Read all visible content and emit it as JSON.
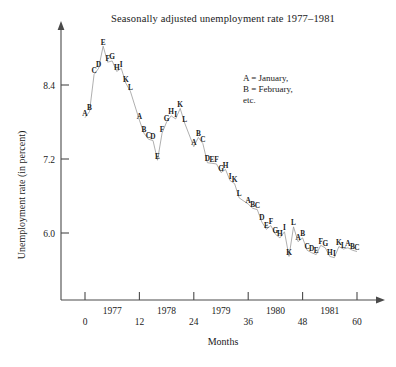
{
  "chart_data": {
    "type": "line",
    "title": "Seasonally adjusted unemployment rate 1977–1981",
    "xlabel": "Months",
    "ylabel": "Unemployment rate (in percent)",
    "xlim": [
      -2,
      64
    ],
    "ylim": [
      5.35,
      9.3
    ],
    "grid": false,
    "legend_position": "upper-right-inside",
    "xticks": [
      0,
      12,
      24,
      36,
      48,
      60
    ],
    "xticklabels": [
      "0",
      "12",
      "24",
      "36",
      "48",
      "60"
    ],
    "year_labels": [
      "1977",
      "1978",
      "1979",
      "1980",
      "1981"
    ],
    "year_label_positions": [
      6,
      18,
      30,
      42,
      54
    ],
    "yticks": [
      6.0,
      7.2,
      8.4
    ],
    "yticklabels": [
      "6.0",
      "7.2",
      "8.4"
    ],
    "legend_lines": [
      "A = January,",
      "B = February,",
      "etc."
    ],
    "point_label_note": "Each plotted point is labelled with a letter for its month: A=January, B=February, C=March, D=April, E=May, F=June, G=July, H=August, I=September, J=October, K=November, L=December",
    "series": [
      {
        "name": "Seasonally adjusted unemployment rate",
        "points": [
          {
            "x": 0,
            "y": 7.87,
            "label": "A"
          },
          {
            "x": 1,
            "y": 7.97,
            "label": "B"
          },
          {
            "x": 2,
            "y": 8.57,
            "label": "C"
          },
          {
            "x": 3,
            "y": 8.67,
            "label": "D"
          },
          {
            "x": 4,
            "y": 9.03,
            "label": "E"
          },
          {
            "x": 5,
            "y": 8.77,
            "label": "F"
          },
          {
            "x": 6,
            "y": 8.79,
            "label": "G"
          },
          {
            "x": 7,
            "y": 8.62,
            "label": "H"
          },
          {
            "x": 8,
            "y": 8.67,
            "label": "I"
          },
          {
            "x": 9,
            "y": 8.43,
            "label": "K"
          },
          {
            "x": 10,
            "y": 8.3,
            "label": "L"
          },
          {
            "x": 12,
            "y": 7.83,
            "label": "A"
          },
          {
            "x": 13,
            "y": 7.62,
            "label": "B"
          },
          {
            "x": 14,
            "y": 7.52,
            "label": "C"
          },
          {
            "x": 15,
            "y": 7.5,
            "label": "D"
          },
          {
            "x": 16,
            "y": 7.18,
            "label": "E"
          },
          {
            "x": 17,
            "y": 7.62,
            "label": "F"
          },
          {
            "x": 18,
            "y": 7.8,
            "label": "G"
          },
          {
            "x": 19,
            "y": 7.9,
            "label": "H"
          },
          {
            "x": 20,
            "y": 7.85,
            "label": "I"
          },
          {
            "x": 21,
            "y": 8.02,
            "label": "K"
          },
          {
            "x": 22,
            "y": 7.78,
            "label": "L"
          },
          {
            "x": 24,
            "y": 7.4,
            "label": "A"
          },
          {
            "x": 25,
            "y": 7.55,
            "label": "B"
          },
          {
            "x": 26,
            "y": 7.45,
            "label": "C"
          },
          {
            "x": 27,
            "y": 7.14,
            "label": "D"
          },
          {
            "x": 28,
            "y": 7.13,
            "label": "E"
          },
          {
            "x": 29,
            "y": 7.12,
            "label": "F"
          },
          {
            "x": 30,
            "y": 6.98,
            "label": "G"
          },
          {
            "x": 31,
            "y": 7.03,
            "label": "H"
          },
          {
            "x": 32,
            "y": 6.85,
            "label": "I"
          },
          {
            "x": 33,
            "y": 6.8,
            "label": "K"
          },
          {
            "x": 34,
            "y": 6.57,
            "label": "L"
          },
          {
            "x": 36,
            "y": 6.47,
            "label": "A"
          },
          {
            "x": 37,
            "y": 6.4,
            "label": "B"
          },
          {
            "x": 38,
            "y": 6.38,
            "label": "C"
          },
          {
            "x": 39,
            "y": 6.18,
            "label": "D"
          },
          {
            "x": 40,
            "y": 6.06,
            "label": "E"
          },
          {
            "x": 41,
            "y": 6.12,
            "label": "F"
          },
          {
            "x": 42,
            "y": 5.98,
            "label": "G"
          },
          {
            "x": 43,
            "y": 5.92,
            "label": "H"
          },
          {
            "x": 44,
            "y": 6.02,
            "label": "I"
          },
          {
            "x": 45,
            "y": 5.62,
            "label": "K"
          },
          {
            "x": 46,
            "y": 6.1,
            "label": "L"
          },
          {
            "x": 47,
            "y": 5.86,
            "label": "A"
          },
          {
            "x": 48,
            "y": 5.92,
            "label": "B"
          },
          {
            "x": 49,
            "y": 5.72,
            "label": "C"
          },
          {
            "x": 50,
            "y": 5.68,
            "label": "D"
          },
          {
            "x": 51,
            "y": 5.65,
            "label": "E"
          },
          {
            "x": 52,
            "y": 5.8,
            "label": "F"
          },
          {
            "x": 53,
            "y": 5.76,
            "label": "G"
          },
          {
            "x": 54,
            "y": 5.62,
            "label": "H"
          },
          {
            "x": 55,
            "y": 5.6,
            "label": "I"
          },
          {
            "x": 56,
            "y": 5.78,
            "label": "K"
          },
          {
            "x": 57,
            "y": 5.74,
            "label": "L"
          },
          {
            "x": 58,
            "y": 5.76,
            "label": "A"
          },
          {
            "x": 59,
            "y": 5.72,
            "label": "B"
          },
          {
            "x": 60,
            "y": 5.7,
            "label": "C"
          }
        ]
      }
    ]
  }
}
